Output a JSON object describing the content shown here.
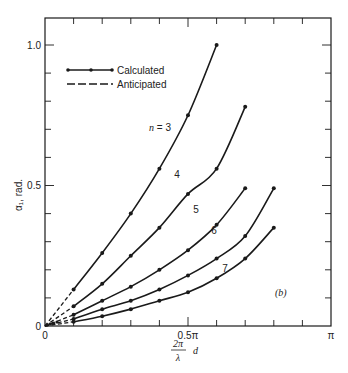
{
  "chart_data": {
    "type": "line",
    "title": "",
    "panel_label": "(b)",
    "xlabel": "(2π/λ) d",
    "xlabel_parts": {
      "numerator": "2π",
      "denominator": "λ",
      "suffix": "d"
    },
    "ylabel": "α₁, rad.",
    "xlim": [
      0,
      3.14159
    ],
    "ylim": [
      0,
      1.1
    ],
    "x_ticks": [
      {
        "value": 0,
        "label": "0"
      },
      {
        "value": 1.5708,
        "label": "0.5π"
      },
      {
        "value": 3.14159,
        "label": "π"
      }
    ],
    "y_ticks": [
      {
        "value": 0,
        "label": "0"
      },
      {
        "value": 0.5,
        "label": "0.5"
      },
      {
        "value": 1.0,
        "label": "1.0"
      }
    ],
    "x_minor_tick_step_pi": 0.1,
    "y_minor_tick_step": 0.1,
    "grid": false,
    "legend_position": "upper-left",
    "legend": [
      {
        "label": "Calculated",
        "style": "solid-with-markers"
      },
      {
        "label": "Anticipated",
        "style": "dashed"
      }
    ],
    "x_unit": "π",
    "series": [
      {
        "name": "n = 3",
        "label": "n = 3",
        "x_pi": [
          0.1,
          0.2,
          0.3,
          0.4,
          0.5,
          0.6
        ],
        "values": [
          0.13,
          0.26,
          0.4,
          0.56,
          0.75,
          1.0
        ]
      },
      {
        "name": "n = 4",
        "label": "4",
        "x_pi": [
          0.1,
          0.2,
          0.3,
          0.4,
          0.5,
          0.6,
          0.7
        ],
        "values": [
          0.07,
          0.15,
          0.25,
          0.35,
          0.47,
          0.56,
          0.78
        ]
      },
      {
        "name": "n = 5",
        "label": "5",
        "x_pi": [
          0.1,
          0.2,
          0.3,
          0.4,
          0.5,
          0.6,
          0.7
        ],
        "values": [
          0.04,
          0.09,
          0.14,
          0.2,
          0.27,
          0.36,
          0.49
        ]
      },
      {
        "name": "n = 6",
        "label": "6",
        "x_pi": [
          0.1,
          0.2,
          0.3,
          0.4,
          0.5,
          0.6,
          0.7,
          0.8
        ],
        "values": [
          0.025,
          0.06,
          0.09,
          0.13,
          0.18,
          0.24,
          0.32,
          0.49
        ]
      },
      {
        "name": "n = 7",
        "label": "7",
        "x_pi": [
          0.1,
          0.2,
          0.3,
          0.4,
          0.5,
          0.6,
          0.7,
          0.8
        ],
        "values": [
          0.015,
          0.035,
          0.06,
          0.09,
          0.12,
          0.17,
          0.24,
          0.35
        ]
      }
    ],
    "anticipated_note": "Dashed segments extend each curve from origin to the first calculated point at 0.1π"
  },
  "colors": {
    "line": "#1a1a1a",
    "background": "#ffffff"
  }
}
